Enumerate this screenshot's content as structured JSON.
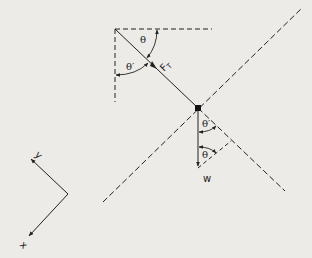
{
  "diagram": {
    "labels": {
      "theta_top": "θ",
      "theta_prime_top": "θ′",
      "tension": "F",
      "tension_sub": "T",
      "theta_prime_bottom": "θ′",
      "theta_bottom": "θ",
      "weight": "w",
      "axis_y": "y",
      "axis_x": "x"
    },
    "colors": {
      "background": "#ecebe8",
      "ink": "#222222"
    }
  }
}
